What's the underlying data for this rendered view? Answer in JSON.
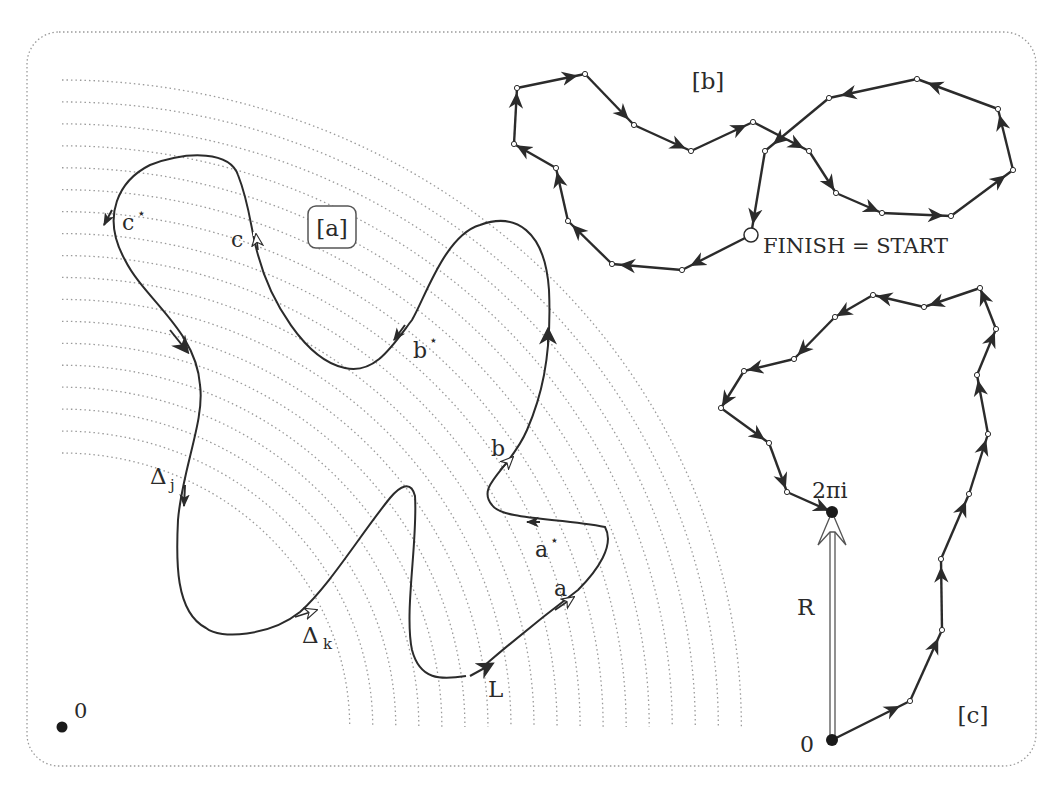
{
  "figure": {
    "frame": {
      "x": 27,
      "y": 32,
      "w": 1009,
      "h": 734,
      "r": 32,
      "color": "#9a9a9a"
    },
    "colors": {
      "curve": "#2b2b2b",
      "grid": "#9a9a9a",
      "point": "#1a1a1a",
      "text": "#2a2a2a"
    }
  },
  "panel_a": {
    "tag": "[a]",
    "origin_label": "0",
    "origin": [
      62,
      727
    ],
    "arc_radii_start": 274,
    "arc_radii_end": 647,
    "arc_count": 18,
    "labels": {
      "c_star": "c",
      "c": "c",
      "b_star": "b",
      "b": "b",
      "a_star": "a",
      "a": "a",
      "delta_j": "Δ",
      "delta_j_sub": "j",
      "delta_k": "Δ",
      "delta_k_sub": "k",
      "L": "L",
      "star": "⋆"
    }
  },
  "panel_b": {
    "tag": "[b]",
    "finish_start_label": "FINISH = START",
    "points": [
      [
        751,
        235
      ],
      [
        682,
        270
      ],
      [
        612,
        264
      ],
      [
        568,
        221
      ],
      [
        556,
        168
      ],
      [
        514,
        144
      ],
      [
        517,
        88
      ],
      [
        585,
        74
      ],
      [
        634,
        125
      ],
      [
        691,
        151
      ],
      [
        753,
        122
      ],
      [
        809,
        151
      ],
      [
        836,
        193
      ],
      [
        882,
        213
      ],
      [
        951,
        216
      ],
      [
        1013,
        170
      ],
      [
        998,
        109
      ],
      [
        917,
        79
      ],
      [
        829,
        98
      ],
      [
        765,
        151
      ],
      [
        751,
        235
      ]
    ]
  },
  "panel_c": {
    "tag": "[c]",
    "origin_label": "0",
    "target_label": "2πi",
    "vector_label": "R",
    "points": [
      [
        832,
        740
      ],
      [
        910,
        701
      ],
      [
        942,
        630
      ],
      [
        941,
        559
      ],
      [
        969,
        494
      ],
      [
        988,
        434
      ],
      [
        977,
        375
      ],
      [
        996,
        329
      ],
      [
        980,
        288
      ],
      [
        924,
        307
      ],
      [
        873,
        295
      ],
      [
        835,
        317
      ],
      [
        794,
        359
      ],
      [
        744,
        371
      ],
      [
        721,
        408
      ],
      [
        769,
        443
      ],
      [
        787,
        492
      ],
      [
        832,
        512
      ]
    ]
  }
}
